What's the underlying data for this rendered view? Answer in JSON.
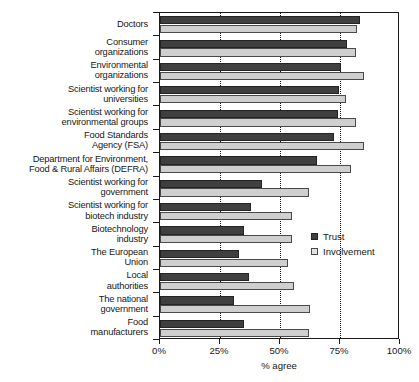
{
  "chart_data": {
    "type": "bar",
    "orientation": "horizontal",
    "title": "",
    "xlabel": "% agree",
    "ylabel": "",
    "xlim": [
      0,
      100
    ],
    "xticks": [
      "0%",
      "25%",
      "50%",
      "75%",
      "100%"
    ],
    "xtick_values": [
      0,
      25,
      50,
      75,
      100
    ],
    "grid": "vertical dotted gridlines at 25%, 50%, 75%",
    "legend_position": "right-middle",
    "categories": [
      "Doctors",
      "Consumer\norganizations",
      "Environmental\norganizations",
      "Scientist working for\nuniversities",
      "Scientist working for\nenvironmental groups",
      "Food Standards\nAgency (FSA)",
      "Department for Environment,\nFood & Rural Affairs (DEFRA)",
      "Scientist working for\ngovernment",
      "Scientist working for\nbiotech industry",
      "Biotechnology\nindustry",
      "The European\nUnion",
      "Local\nauthorities",
      "The national\ngovernment",
      "Food\nmanufacturers"
    ],
    "series": [
      {
        "name": "Trust",
        "color": "#3f3f3f",
        "values": [
          83.5,
          78.0,
          75.5,
          74.5,
          74.0,
          72.5,
          65.5,
          42.5,
          38.0,
          35.0,
          33.0,
          37.0,
          31.0,
          35.0
        ]
      },
      {
        "name": "Involvement",
        "color": "#cfcfcf",
        "values": [
          82.0,
          81.5,
          85.0,
          77.5,
          81.5,
          85.0,
          79.5,
          62.0,
          55.0,
          55.0,
          53.5,
          56.0,
          62.5,
          62.0
        ]
      }
    ]
  },
  "legend": {
    "items": [
      {
        "label": "Trust",
        "swatch": "trust"
      },
      {
        "label": "Involvement",
        "swatch": "involvement"
      }
    ]
  },
  "axis": {
    "x_title": "% agree"
  }
}
